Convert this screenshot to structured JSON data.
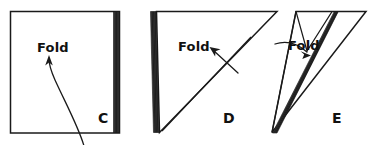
{
  "figure": {
    "background_color": "#ffffff",
    "ink_color": "#1a1a1a",
    "width": 375,
    "height": 145,
    "panels": [
      {
        "id": "C",
        "panel_label": "C",
        "panel_label_x": 98,
        "panel_label_y": 123,
        "shape": "square",
        "description": "Square sheet of paper with folded layered edge along the right side",
        "fold_label": "Fold",
        "fold_label_x": 37,
        "fold_label_y": 52,
        "arrow_style": "curved-upward",
        "outline_points": "10,11 120,11 120,133 10,133"
      },
      {
        "id": "D",
        "panel_label": "D",
        "panel_label_x": 223,
        "panel_label_y": 123,
        "shape": "right-triangle",
        "description": "Paper folded once into a right triangle with layered edge along the left side and a diagonal crease",
        "fold_label": "Fold",
        "fold_label_x": 178,
        "fold_label_y": 51,
        "arrow_style": "straight-upper-left",
        "outline_points": "156,11 277,11 159,133"
      },
      {
        "id": "E",
        "panel_label": "E",
        "panel_label_x": 332,
        "panel_label_y": 123,
        "shape": "narrow-triangle",
        "description": "Paper folded again into a narrow triangle with a shaded layered fold edge running to the lower-left point",
        "fold_label": "Fold",
        "fold_label_x": 305,
        "fold_label_y": 50,
        "arrow_style": "straight-lower-right",
        "outline_points": "296,11 366,11 272,133"
      }
    ]
  }
}
